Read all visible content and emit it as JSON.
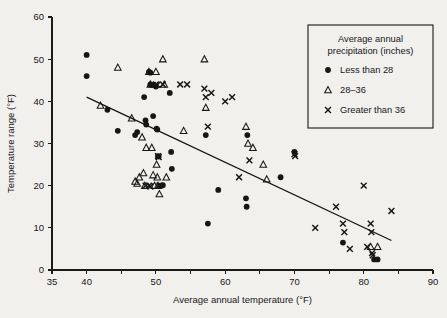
{
  "chart_data": {
    "type": "scatter",
    "title": "",
    "xlabel": "Average annual temperature (°F)",
    "ylabel": "Temperature range (°F)",
    "xlim": [
      35,
      90
    ],
    "ylim": [
      0,
      60
    ],
    "xticks": [
      35,
      40,
      45,
      50,
      55,
      60,
      65,
      70,
      75,
      80,
      85,
      90
    ],
    "xtick_labels": [
      "35",
      "40",
      "",
      "50",
      "",
      "60",
      "",
      "70",
      "",
      "80",
      "",
      "90"
    ],
    "yticks": [
      0,
      10,
      20,
      30,
      40,
      50,
      60
    ],
    "ytick_labels": [
      "0",
      "10",
      "20",
      "30",
      "40",
      "50",
      "60"
    ],
    "grid": false,
    "legend_position": "top-right",
    "legend_title": "Average annual precipitation (inches)",
    "legend_title_line1": "Average annual",
    "legend_title_line2": "precipitation (inches)",
    "marker_color": "#161616",
    "trendline": {
      "label": "fitted line",
      "x": [
        40,
        84
      ],
      "y": [
        41,
        7
      ]
    },
    "series": [
      {
        "name": "Less than 28",
        "marker": "circle",
        "points": [
          [
            40.0,
            51.0
          ],
          [
            40.0,
            46.0
          ],
          [
            43.0,
            38.0
          ],
          [
            44.5,
            33.0
          ],
          [
            47.0,
            32.0
          ],
          [
            47.3,
            32.7
          ],
          [
            48.3,
            41.0
          ],
          [
            48.5,
            35.5
          ],
          [
            48.6,
            34.5
          ],
          [
            49.0,
            47.0
          ],
          [
            49.2,
            46.8
          ],
          [
            49.2,
            44.0
          ],
          [
            49.4,
            43.9
          ],
          [
            49.6,
            36.5
          ],
          [
            50.0,
            43.5
          ],
          [
            50.1,
            33.5
          ],
          [
            50.2,
            33.3
          ],
          [
            50.3,
            27.0
          ],
          [
            50.4,
            26.9
          ],
          [
            50.6,
            20.0
          ],
          [
            51.0,
            20.1
          ],
          [
            52.0,
            42.0
          ],
          [
            52.2,
            28.0
          ],
          [
            52.3,
            24.0
          ],
          [
            57.2,
            32.0
          ],
          [
            57.5,
            11.0
          ],
          [
            59.0,
            19.0
          ],
          [
            63.0,
            17.0
          ],
          [
            63.1,
            15.0
          ],
          [
            63.2,
            32.0
          ],
          [
            68.0,
            22.0
          ],
          [
            70.0,
            28.0
          ],
          [
            77.0,
            6.5
          ],
          [
            81.5,
            2.5
          ],
          [
            82.0,
            2.5
          ]
        ]
      },
      {
        "name": "28–36",
        "marker": "triangle",
        "points": [
          [
            42.0,
            39.0
          ],
          [
            44.5,
            48.0
          ],
          [
            46.5,
            36.0
          ],
          [
            47.0,
            21.0
          ],
          [
            47.3,
            20.5
          ],
          [
            47.6,
            22.0
          ],
          [
            48.0,
            31.5
          ],
          [
            48.2,
            23.0
          ],
          [
            48.4,
            20.0
          ],
          [
            48.6,
            29.0
          ],
          [
            49.0,
            47.0
          ],
          [
            49.2,
            44.0
          ],
          [
            49.4,
            29.0
          ],
          [
            49.6,
            22.5
          ],
          [
            49.8,
            20.0
          ],
          [
            50.0,
            47.0
          ],
          [
            50.1,
            25.0
          ],
          [
            50.2,
            22.0
          ],
          [
            50.3,
            20.0
          ],
          [
            50.5,
            18.0
          ],
          [
            51.0,
            50.0
          ],
          [
            51.2,
            44.0
          ],
          [
            51.5,
            22.0
          ],
          [
            54.0,
            33.0
          ],
          [
            57.0,
            50.0
          ],
          [
            57.2,
            38.5
          ],
          [
            63.0,
            34.0
          ],
          [
            63.3,
            30.0
          ],
          [
            64.0,
            29.0
          ],
          [
            65.5,
            25.0
          ],
          [
            66.0,
            21.5
          ],
          [
            81.0,
            5.5
          ],
          [
            82.0,
            5.5
          ]
        ]
      },
      {
        "name": "Greater than 36",
        "marker": "cross",
        "points": [
          [
            48.5,
            20.0
          ],
          [
            49.0,
            20.0
          ],
          [
            49.2,
            19.8
          ],
          [
            50.0,
            44.0
          ],
          [
            50.2,
            43.9
          ],
          [
            50.3,
            27.0
          ],
          [
            50.4,
            26.8
          ],
          [
            50.5,
            20.0
          ],
          [
            51.0,
            44.0
          ],
          [
            53.5,
            44.0
          ],
          [
            54.5,
            44.0
          ],
          [
            57.0,
            43.0
          ],
          [
            57.2,
            41.0
          ],
          [
            57.5,
            34.0
          ],
          [
            58.0,
            42.0
          ],
          [
            60.0,
            40.0
          ],
          [
            61.0,
            41.0
          ],
          [
            62.0,
            22.0
          ],
          [
            63.5,
            26.0
          ],
          [
            70.0,
            27.5
          ],
          [
            70.1,
            27.0
          ],
          [
            73.0,
            10.0
          ],
          [
            76.0,
            15.0
          ],
          [
            77.0,
            11.0
          ],
          [
            77.2,
            9.0
          ],
          [
            78.0,
            5.0
          ],
          [
            80.0,
            20.0
          ],
          [
            80.5,
            5.5
          ],
          [
            81.0,
            11.0
          ],
          [
            81.1,
            9.0
          ],
          [
            81.2,
            4.0
          ],
          [
            81.3,
            3.5
          ],
          [
            84.0,
            14.0
          ]
        ]
      }
    ]
  },
  "legend": {
    "title_line1": "Average annual",
    "title_line2": "precipitation (inches)",
    "entries": [
      {
        "label": "Less than 28",
        "marker": "circle"
      },
      {
        "label": "28–36",
        "marker": "triangle"
      },
      {
        "label": "Greater than 36",
        "marker": "cross"
      }
    ]
  }
}
